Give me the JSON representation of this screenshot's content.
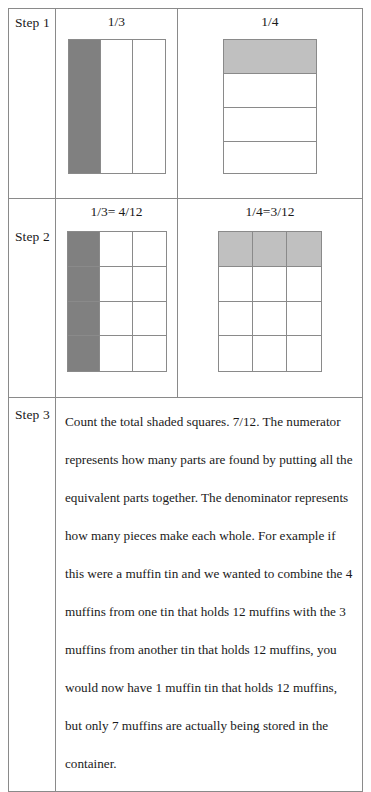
{
  "table": {
    "rows": [
      {
        "step_label": "Step 1",
        "left": {
          "header": "1/3",
          "model": "vertical-thirds",
          "parts": 3,
          "shaded": 1,
          "shade_color": "#808080"
        },
        "right": {
          "header": "1/4",
          "model": "horizontal-fourths",
          "parts": 4,
          "shaded": 1,
          "shade_color": "#c0c0c0"
        }
      },
      {
        "step_label": "Step 2",
        "left": {
          "header": "1/3= 4/12",
          "model": "grid-12",
          "columns": 3,
          "rows": 4,
          "shaded_cells": [
            0,
            3,
            6,
            9
          ],
          "shaded_count": 4,
          "shade_color": "#808080"
        },
        "right": {
          "header": "1/4=3/12",
          "model": "grid-12",
          "columns": 3,
          "rows": 4,
          "shaded_cells": [
            0,
            1,
            2
          ],
          "shaded_count": 3,
          "shade_color": "#c0c0c0"
        }
      },
      {
        "step_label": "Step 3",
        "paragraph": "Count the total shaded squares. 7/12. The numerator represents how many parts are found by putting all the equivalent parts together. The denominator represents how many pieces make each whole. For example if this were a muffin tin and we wanted to combine the 4 muffins from one tin that holds 12 muffins with the 3 muffins from another tin that holds 12 muffins, you would now have 1 muffin tin that holds 12 muffins, but only 7 muffins are actually being stored in the container."
      }
    ]
  },
  "colors": {
    "border": "#8a8a8a",
    "shade_dark": "#808080",
    "shade_light": "#c0c0c0",
    "background": "#ffffff",
    "text": "#1a1a1a"
  }
}
